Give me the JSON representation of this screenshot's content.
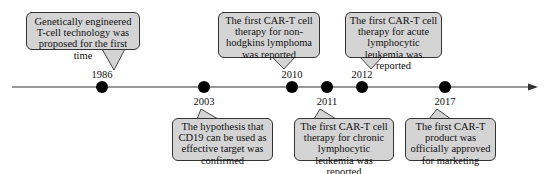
{
  "timeline": {
    "events": [
      {
        "year": "1986",
        "position": "above",
        "text": "Genetically engineered T-cell technology was proposed for the first time"
      },
      {
        "year": "2003",
        "position": "below",
        "text": "The hypothesis that CD19 can be used as effective target was confirmed"
      },
      {
        "year": "2010",
        "position": "above",
        "text": "The first CAR-T cell therapy for non-hodgkins lymphoma was reported"
      },
      {
        "year": "2011",
        "position": "below",
        "text": "The first CAR-T cell therapy for chronic lymphocytic leukemia was reported"
      },
      {
        "year": "2012",
        "position": "above",
        "text": "The first CAR-T cell therapy for acute lymphocytic leukemia was reported"
      },
      {
        "year": "2017",
        "position": "below",
        "text": "The first CAR-T product was officially approved for marketing"
      }
    ]
  },
  "colors": {
    "box_fill": "#d4d4d4",
    "box_border": "#333333",
    "axis": "#333333",
    "dot": "#000000",
    "background": "#ffffff"
  }
}
